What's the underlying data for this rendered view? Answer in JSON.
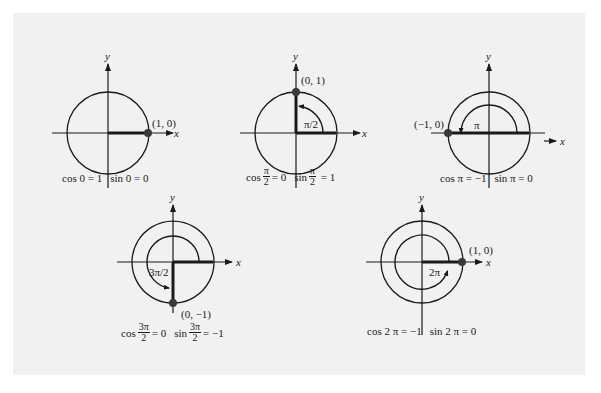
{
  "figure": {
    "background": "#f1f1f1",
    "stroke_color": "#1a1a1a",
    "axis_labels": {
      "x": "x",
      "y": "y"
    },
    "diagrams": [
      {
        "id": "angle-0",
        "point_label": "(1, 0)",
        "angle_label": "",
        "caption": {
          "cos_fn": "cos",
          "cos_arg": "0",
          "cos_eq": "= 1",
          "sin_fn": "sin",
          "sin_arg": "0",
          "sin_eq": "= 0"
        }
      },
      {
        "id": "angle-pi-over-2",
        "point_label": "(0, 1)",
        "angle_label": "π/2",
        "caption": {
          "cos_fn": "cos",
          "cos_num": "π",
          "cos_den": "2",
          "cos_eq": "= 0",
          "sin_fn": "sin",
          "sin_num": "π",
          "sin_den": "2",
          "sin_eq": "= 1"
        }
      },
      {
        "id": "angle-pi",
        "point_label": "(−1, 0)",
        "angle_label": "π",
        "caption": {
          "cos_fn": "cos",
          "cos_arg": "π",
          "cos_eq": "= −1",
          "sin_fn": "sin",
          "sin_arg": "π",
          "sin_eq": "= 0"
        }
      },
      {
        "id": "angle-3pi-over-2",
        "point_label": "(0, −1)",
        "angle_label": "3π/2",
        "caption": {
          "cos_fn": "cos",
          "cos_num": "3π",
          "cos_den": "2",
          "cos_eq": "= 0",
          "sin_fn": "sin",
          "sin_num": "3π",
          "sin_den": "2",
          "sin_eq": "= −1"
        }
      },
      {
        "id": "angle-2pi",
        "point_label": "(1, 0)",
        "angle_label": "2π",
        "caption": {
          "cos_fn": "cos",
          "cos_arg": "2 π",
          "cos_eq": "= −1",
          "sin_fn": "sin",
          "sin_arg": "2 π",
          "sin_eq": "= 0"
        }
      }
    ]
  }
}
